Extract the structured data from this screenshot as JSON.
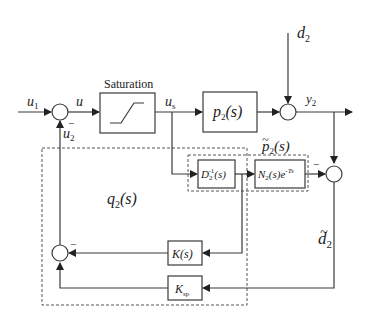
{
  "diagram": {
    "type": "block-diagram",
    "signals": {
      "u1": {
        "base": "u",
        "sub": "1"
      },
      "u": {
        "base": "u"
      },
      "us": {
        "base": "u",
        "sub": "s"
      },
      "y2": {
        "base": "y",
        "sub": "2"
      },
      "d2": {
        "base": "d",
        "sub": "2"
      },
      "u2": {
        "base": "u",
        "sub": "2"
      },
      "d2_tilde": {
        "base": "d",
        "sub": "2",
        "accent": "~"
      }
    },
    "blocks": {
      "saturation": {
        "label": "Saturation"
      },
      "plant": {
        "base": "p",
        "sub": "2",
        "arg": "(s)"
      },
      "model_group": {
        "base": "p",
        "sub": "2",
        "arg": "(s)",
        "accent": "~"
      },
      "dinv": {
        "base": "D",
        "sub": "2",
        "sup": "-1",
        "arg": "(s)"
      },
      "n2": {
        "base": "N",
        "sub": "2",
        "arg": "(s)e",
        "exp": "-Ts"
      },
      "k": {
        "base": "K",
        "arg": "(s)"
      },
      "ksp": {
        "base": "K",
        "sub": "sp"
      },
      "q2_group": {
        "base": "q",
        "sub": "2",
        "arg": "(s)"
      }
    },
    "signs": {
      "minus": "−"
    }
  }
}
